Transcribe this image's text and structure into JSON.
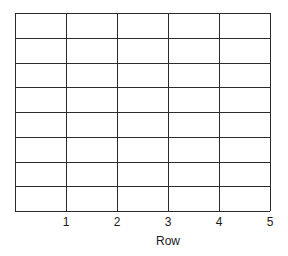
{
  "chart_data": {
    "type": "table",
    "title": "",
    "xlabel": "Row",
    "ylabel": "",
    "xlim": [
      0,
      5
    ],
    "x_ticks": [
      "1",
      "2",
      "3",
      "4",
      "5"
    ],
    "grid_columns": 5,
    "grid_rows": 8,
    "grid": true,
    "series": [],
    "line_color": "#2b2b2b"
  }
}
